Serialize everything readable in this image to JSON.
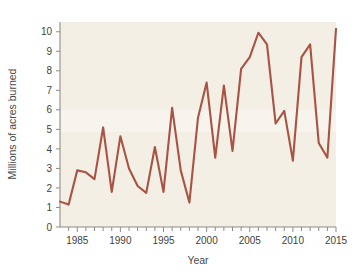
{
  "chart_data": {
    "type": "line",
    "title": "",
    "xlabel": "Year",
    "ylabel": "Millions of acres burned",
    "xlim": [
      1983,
      2015
    ],
    "ylim": [
      0,
      10.5
    ],
    "grid": false,
    "legend": "none",
    "line_color": "#a85343",
    "plot_background": "#f3efe5",
    "x_tick_labels": [
      "1985",
      "1990",
      "1995",
      "2000",
      "2005",
      "2010",
      "2015"
    ],
    "x_tick_values": [
      1985,
      1990,
      1995,
      2000,
      2005,
      2010,
      2015
    ],
    "x_minor_ticks": [
      1984,
      1986,
      1987,
      1988,
      1989,
      1991,
      1992,
      1993,
      1994,
      1996,
      1997,
      1998,
      1999,
      2001,
      2002,
      2003,
      2004,
      2006,
      2007,
      2008,
      2009,
      2011,
      2012,
      2013,
      2014
    ],
    "y_tick_labels": [
      "0",
      "1",
      "2",
      "3",
      "4",
      "5",
      "6",
      "7",
      "8",
      "9",
      "10"
    ],
    "y_tick_values": [
      0,
      1,
      2,
      3,
      4,
      5,
      6,
      7,
      8,
      9,
      10
    ],
    "x": [
      1983,
      1984,
      1985,
      1986,
      1987,
      1988,
      1989,
      1990,
      1991,
      1992,
      1993,
      1994,
      1995,
      1996,
      1997,
      1998,
      1999,
      2000,
      2001,
      2002,
      2003,
      2004,
      2005,
      2006,
      2007,
      2008,
      2009,
      2010,
      2011,
      2012,
      2013,
      2014,
      2015
    ],
    "values": [
      1.3,
      1.15,
      2.9,
      2.8,
      2.45,
      5.1,
      1.8,
      4.65,
      3.0,
      2.1,
      1.75,
      4.1,
      1.8,
      6.1,
      2.9,
      1.25,
      5.6,
      7.4,
      3.55,
      7.25,
      3.9,
      8.1,
      8.7,
      9.95,
      9.35,
      5.3,
      5.95,
      3.4,
      8.7,
      9.35,
      4.3,
      3.55,
      10.15
    ],
    "series_name": "Acres burned"
  }
}
